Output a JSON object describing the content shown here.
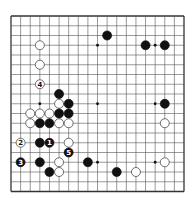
{
  "diagram": {
    "type": "go-board",
    "size": 19,
    "colors": {
      "background": "#ffffff",
      "line": "#555555",
      "border": "#333333",
      "black_stone": "#111111",
      "white_stone": "#ffffff",
      "white_stone_edge": "#333333"
    },
    "star_points": [
      [
        3,
        3
      ],
      [
        9,
        3
      ],
      [
        15,
        3
      ],
      [
        3,
        9
      ],
      [
        9,
        9
      ],
      [
        15,
        9
      ],
      [
        3,
        15
      ],
      [
        9,
        15
      ],
      [
        15,
        15
      ]
    ],
    "stones": [
      {
        "color": "black",
        "col": 10,
        "row": 2,
        "label": ""
      },
      {
        "color": "black",
        "col": 14,
        "row": 3,
        "label": ""
      },
      {
        "color": "black",
        "col": 16,
        "row": 3,
        "label": ""
      },
      {
        "color": "white",
        "col": 3,
        "row": 3,
        "label": ""
      },
      {
        "color": "white",
        "col": 3,
        "row": 5,
        "label": ""
      },
      {
        "color": "white",
        "col": 3,
        "row": 7,
        "label": "4"
      },
      {
        "color": "black",
        "col": 5,
        "row": 8,
        "label": ""
      },
      {
        "color": "white",
        "col": 5,
        "row": 9,
        "label": ""
      },
      {
        "color": "black",
        "col": 6,
        "row": 9,
        "label": ""
      },
      {
        "color": "black",
        "col": 16,
        "row": 9,
        "label": ""
      },
      {
        "color": "white",
        "col": 2,
        "row": 10,
        "label": ""
      },
      {
        "color": "white",
        "col": 3,
        "row": 10,
        "label": ""
      },
      {
        "color": "white",
        "col": 4,
        "row": 10,
        "label": ""
      },
      {
        "color": "black",
        "col": 5,
        "row": 10,
        "label": ""
      },
      {
        "color": "black",
        "col": 6,
        "row": 10,
        "label": ""
      },
      {
        "color": "white",
        "col": 2,
        "row": 11,
        "label": ""
      },
      {
        "color": "black",
        "col": 3,
        "row": 11,
        "label": ""
      },
      {
        "color": "black",
        "col": 4,
        "row": 11,
        "label": ""
      },
      {
        "color": "white",
        "col": 5,
        "row": 11,
        "label": ""
      },
      {
        "color": "white",
        "col": 6,
        "row": 11,
        "label": ""
      },
      {
        "color": "white",
        "col": 16,
        "row": 11,
        "label": ""
      },
      {
        "color": "white",
        "col": 1,
        "row": 13,
        "label": "2"
      },
      {
        "color": "black",
        "col": 3,
        "row": 13,
        "label": ""
      },
      {
        "color": "black",
        "col": 4,
        "row": 13,
        "label": "1"
      },
      {
        "color": "white",
        "col": 6,
        "row": 13,
        "label": ""
      },
      {
        "color": "black",
        "col": 6,
        "row": 14,
        "label": "5"
      },
      {
        "color": "black",
        "col": 1,
        "row": 15,
        "label": "3"
      },
      {
        "color": "black",
        "col": 3,
        "row": 15,
        "label": ""
      },
      {
        "color": "white",
        "col": 5,
        "row": 15,
        "label": ""
      },
      {
        "color": "black",
        "col": 8,
        "row": 15,
        "label": ""
      },
      {
        "color": "white",
        "col": 16,
        "row": 15,
        "label": ""
      },
      {
        "color": "black",
        "col": 4,
        "row": 16,
        "label": ""
      },
      {
        "color": "white",
        "col": 5,
        "row": 16,
        "label": ""
      },
      {
        "color": "black",
        "col": 11,
        "row": 16,
        "label": ""
      },
      {
        "color": "white",
        "col": 13,
        "row": 16,
        "label": ""
      }
    ]
  }
}
